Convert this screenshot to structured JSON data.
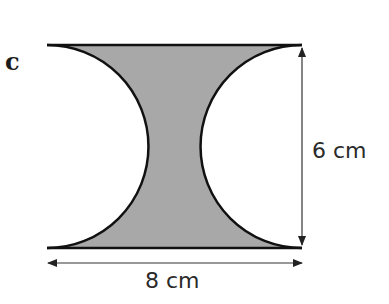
{
  "part_label": "c",
  "shape": {
    "description": "Rectangle 8 cm by 6 cm with two semicircular regions removed from the left and right sides; remaining shaded region",
    "width_label": "8 cm",
    "height_label": "6 cm",
    "fill_color": "#a8a8a8",
    "stroke_color": "#111111"
  },
  "dimensions": {
    "width": {
      "value": 8,
      "unit": "cm",
      "label": "8 cm"
    },
    "height": {
      "value": 6,
      "unit": "cm",
      "label": "6 cm"
    }
  }
}
